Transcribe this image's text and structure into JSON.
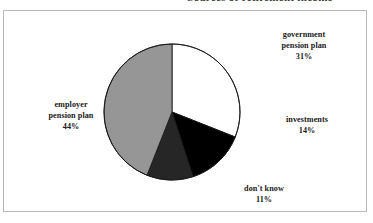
{
  "figure": {
    "title_clipped": "Sources of retirement income",
    "frame_color": "#b9b9b9",
    "background": "#ffffff"
  },
  "chart_data": {
    "type": "pie",
    "title": "",
    "xlabel": "",
    "ylabel": "",
    "legend_position": "none",
    "grid": false,
    "start_angle_deg": 0,
    "direction": "clockwise",
    "categories": [
      "government pension plan",
      "investments",
      "don't know",
      "employer pension plan"
    ],
    "values": [
      31,
      14,
      11,
      44
    ],
    "value_suffix": "%",
    "colors": [
      "#ffffff",
      "#000000",
      "#262626",
      "#969696"
    ],
    "slices": [
      {
        "label_line1": "government",
        "label_line2": "pension plan",
        "name": "government pension plan",
        "value": 31,
        "value_text": "31%",
        "color": "#ffffff"
      },
      {
        "label_line1": "investments",
        "label_line2": "",
        "name": "investments",
        "value": 14,
        "value_text": "14%",
        "color": "#000000"
      },
      {
        "label_line1": "don't know",
        "label_line2": "",
        "name": "don't know",
        "value": 11,
        "value_text": "11%",
        "color": "#262626"
      },
      {
        "label_line1": "employer",
        "label_line2": "pension plan",
        "name": "employer pension plan",
        "value": 44,
        "value_text": "44%",
        "color": "#969696"
      }
    ]
  },
  "geometry": {
    "cx": 172,
    "cy": 112,
    "r": 68
  }
}
